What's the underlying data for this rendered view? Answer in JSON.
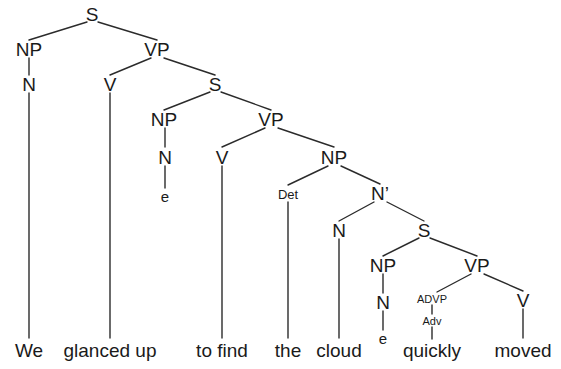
{
  "figure": {
    "kind": "syntax-tree",
    "sentence": "We glanced up to find the cloud quickly moved",
    "background_color": "#ffffff",
    "line_color": "#2b2b2b",
    "text_color": "#1a1a1a",
    "caption": "",
    "width": 561,
    "height": 369
  },
  "nodes": [
    {
      "id": "S1",
      "label": "S",
      "x": 92,
      "y": 14,
      "size": "node"
    },
    {
      "id": "NP1",
      "label": "NP",
      "x": 29,
      "y": 49,
      "size": "node"
    },
    {
      "id": "VP1",
      "label": "VP",
      "x": 157,
      "y": 49,
      "size": "node"
    },
    {
      "id": "N1",
      "label": "N",
      "x": 29,
      "y": 84,
      "size": "node"
    },
    {
      "id": "V1",
      "label": "V",
      "x": 110,
      "y": 84,
      "size": "node"
    },
    {
      "id": "S2",
      "label": "S",
      "x": 215,
      "y": 84,
      "size": "node"
    },
    {
      "id": "NP2",
      "label": "NP",
      "x": 164,
      "y": 119,
      "size": "node"
    },
    {
      "id": "VP2",
      "label": "VP",
      "x": 271,
      "y": 119,
      "size": "node"
    },
    {
      "id": "N2",
      "label": "N",
      "x": 165,
      "y": 157,
      "size": "node"
    },
    {
      "id": "E1",
      "label": "e",
      "x": 165,
      "y": 196,
      "size": "empty"
    },
    {
      "id": "V2",
      "label": "V",
      "x": 222,
      "y": 157,
      "size": "node"
    },
    {
      "id": "NP3",
      "label": "NP",
      "x": 334,
      "y": 157,
      "size": "node"
    },
    {
      "id": "Det1",
      "label": "Det",
      "x": 288,
      "y": 194,
      "size": "node-sm"
    },
    {
      "id": "Nbar1",
      "label": "N’",
      "x": 380,
      "y": 193,
      "size": "node"
    },
    {
      "id": "N3",
      "label": "N",
      "x": 339,
      "y": 230,
      "size": "node"
    },
    {
      "id": "S3",
      "label": "S",
      "x": 424,
      "y": 230,
      "size": "node"
    },
    {
      "id": "NP4",
      "label": "NP",
      "x": 383,
      "y": 265,
      "size": "node"
    },
    {
      "id": "VP3",
      "label": "VP",
      "x": 477,
      "y": 265,
      "size": "node"
    },
    {
      "id": "N4",
      "label": "N",
      "x": 383,
      "y": 302,
      "size": "node"
    },
    {
      "id": "E2",
      "label": "e",
      "x": 383,
      "y": 338,
      "size": "empty"
    },
    {
      "id": "ADVP1",
      "label": "ADVP",
      "x": 432,
      "y": 299,
      "size": "node-xs"
    },
    {
      "id": "Adv1",
      "label": "Adv",
      "x": 432,
      "y": 321,
      "size": "node-xs"
    },
    {
      "id": "V3",
      "label": "V",
      "x": 523,
      "y": 300,
      "size": "node"
    }
  ],
  "words": [
    {
      "id": "W1",
      "label": "We",
      "x": 29,
      "y": 350
    },
    {
      "id": "W2",
      "label": "glanced up",
      "x": 110,
      "y": 350
    },
    {
      "id": "W3",
      "label": "to find",
      "x": 222,
      "y": 350
    },
    {
      "id": "W4",
      "label": "the",
      "x": 288,
      "y": 350
    },
    {
      "id": "W5",
      "label": "cloud",
      "x": 339,
      "y": 350
    },
    {
      "id": "W6",
      "label": "quickly",
      "x": 432,
      "y": 350
    },
    {
      "id": "W7",
      "label": "moved",
      "x": 523,
      "y": 350
    }
  ],
  "edges": [
    {
      "from": "S1",
      "to": "NP1",
      "x1": 87,
      "y1": 22,
      "x2": 29,
      "y2": 40
    },
    {
      "from": "S1",
      "to": "VP1",
      "x1": 98,
      "y1": 22,
      "x2": 157,
      "y2": 40
    },
    {
      "from": "NP1",
      "to": "N1",
      "x1": 29,
      "y1": 58,
      "x2": 29,
      "y2": 75
    },
    {
      "from": "N1",
      "to": "W1",
      "x1": 29,
      "y1": 93,
      "x2": 29,
      "y2": 338
    },
    {
      "from": "VP1",
      "to": "V1",
      "x1": 151,
      "y1": 58,
      "x2": 110,
      "y2": 75
    },
    {
      "from": "VP1",
      "to": "S2",
      "x1": 164,
      "y1": 58,
      "x2": 215,
      "y2": 75
    },
    {
      "from": "V1",
      "to": "W2",
      "x1": 110,
      "y1": 93,
      "x2": 110,
      "y2": 338
    },
    {
      "from": "S2",
      "to": "NP2",
      "x1": 210,
      "y1": 92,
      "x2": 164,
      "y2": 110
    },
    {
      "from": "S2",
      "to": "VP2",
      "x1": 221,
      "y1": 92,
      "x2": 271,
      "y2": 110
    },
    {
      "from": "NP2",
      "to": "N2",
      "x1": 165,
      "y1": 128,
      "x2": 165,
      "y2": 147
    },
    {
      "from": "N2",
      "to": "E1",
      "x1": 165,
      "y1": 166,
      "x2": 165,
      "y2": 188
    },
    {
      "from": "VP2",
      "to": "V2",
      "x1": 265,
      "y1": 128,
      "x2": 222,
      "y2": 147
    },
    {
      "from": "VP2",
      "to": "NP3",
      "x1": 278,
      "y1": 128,
      "x2": 334,
      "y2": 147
    },
    {
      "from": "V2",
      "to": "W3",
      "x1": 222,
      "y1": 166,
      "x2": 222,
      "y2": 338
    },
    {
      "from": "NP3",
      "to": "Det1",
      "x1": 328,
      "y1": 166,
      "x2": 288,
      "y2": 185
    },
    {
      "from": "NP3",
      "to": "Nbar1",
      "x1": 341,
      "y1": 166,
      "x2": 380,
      "y2": 184
    },
    {
      "from": "Det1",
      "to": "W4",
      "x1": 288,
      "y1": 202,
      "x2": 288,
      "y2": 338
    },
    {
      "from": "Nbar1",
      "to": "N3",
      "x1": 374,
      "y1": 202,
      "x2": 339,
      "y2": 221
    },
    {
      "from": "Nbar1",
      "to": "S3",
      "x1": 387,
      "y1": 202,
      "x2": 424,
      "y2": 221
    },
    {
      "from": "N3",
      "to": "W5",
      "x1": 339,
      "y1": 239,
      "x2": 339,
      "y2": 338
    },
    {
      "from": "S3",
      "to": "NP4",
      "x1": 419,
      "y1": 238,
      "x2": 383,
      "y2": 256
    },
    {
      "from": "S3",
      "to": "VP3",
      "x1": 430,
      "y1": 238,
      "x2": 477,
      "y2": 256
    },
    {
      "from": "NP4",
      "to": "N4",
      "x1": 383,
      "y1": 274,
      "x2": 383,
      "y2": 293
    },
    {
      "from": "N4",
      "to": "E2",
      "x1": 383,
      "y1": 311,
      "x2": 383,
      "y2": 330
    },
    {
      "from": "VP3",
      "to": "ADVP1",
      "x1": 471,
      "y1": 274,
      "x2": 437,
      "y2": 292
    },
    {
      "from": "VP3",
      "to": "V3",
      "x1": 484,
      "y1": 274,
      "x2": 523,
      "y2": 291
    },
    {
      "from": "ADVP1",
      "to": "Adv1",
      "x1": 432,
      "y1": 305,
      "x2": 432,
      "y2": 314
    },
    {
      "from": "Adv1",
      "to": "W6",
      "x1": 432,
      "y1": 327,
      "x2": 432,
      "y2": 339
    },
    {
      "from": "V3",
      "to": "W7",
      "x1": 523,
      "y1": 309,
      "x2": 523,
      "y2": 338
    }
  ]
}
